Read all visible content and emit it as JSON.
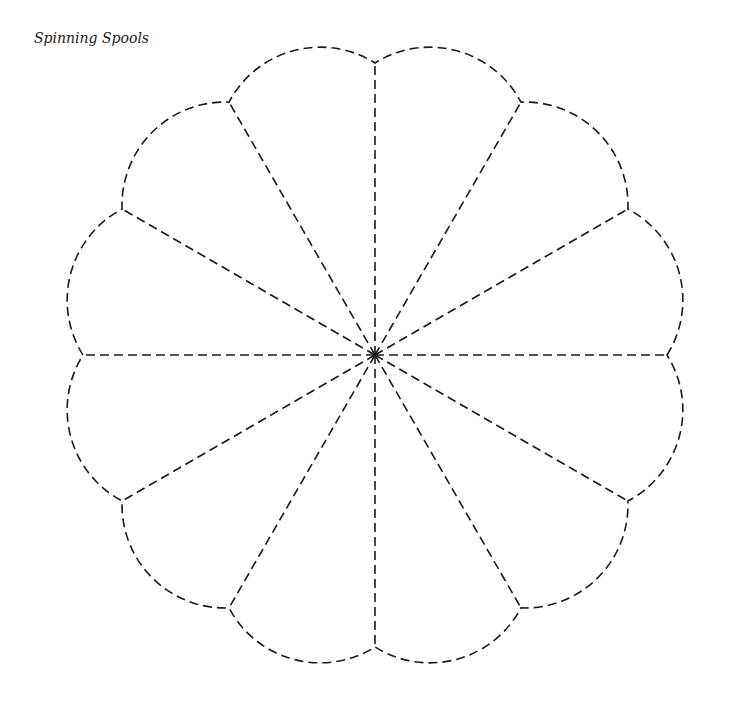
{
  "title": "Spinning Spools",
  "pattern": {
    "type": "dresden-plate-scalloped",
    "petals": 12,
    "center": [
      375,
      355
    ],
    "notch_radius": 292,
    "arc_radius": 103,
    "stroke_color": "#1a1a1a",
    "dash": "9 5"
  }
}
